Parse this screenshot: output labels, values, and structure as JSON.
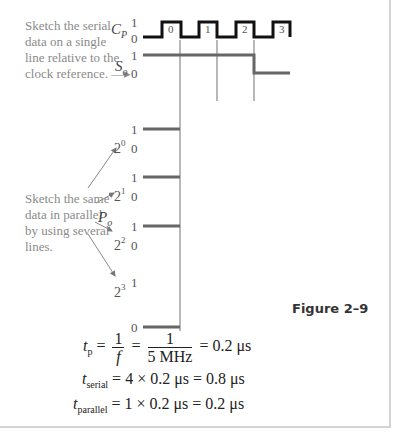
{
  "figure": {
    "label": "Figure 2–9",
    "notes": {
      "serial": [
        "Sketch the serial",
        "data on a single",
        "line relative to the",
        "clock reference. —▸"
      ],
      "parallel": [
        "Sketch the same",
        "data in parallel",
        "by using several",
        "lines."
      ]
    },
    "signals": {
      "clock": {
        "name": "C",
        "sub": "P",
        "high": "1",
        "low": "0",
        "pulse_labels": [
          "0",
          "1",
          "2",
          "3"
        ]
      },
      "serial": {
        "name": "S",
        "sub": "o",
        "high": "1",
        "low": "0"
      },
      "parallel_group": {
        "name": "P",
        "sub": "o"
      },
      "parallel_bits": [
        {
          "base": "2",
          "exp": "0",
          "high": "1",
          "low": "0",
          "value": 1
        },
        {
          "base": "2",
          "exp": "1",
          "high": "1",
          "low": "0",
          "value": 1
        },
        {
          "base": "2",
          "exp": "2",
          "high": "1",
          "low": "0",
          "value": 1
        },
        {
          "base": "2",
          "exp": "3",
          "high": "1",
          "low": "0",
          "value": 0
        }
      ]
    },
    "colors": {
      "clock": "#111111",
      "signal": "#666666",
      "guide": "#888888",
      "note": "#8a8a8a"
    }
  },
  "equations": {
    "eq1": {
      "lhs": "t",
      "lhs_sub": "p",
      "eq": "=",
      "frac1_num": "1",
      "frac1_den": "f",
      "frac2_num": "1",
      "frac2_den": "5 MHz",
      "result": "= 0.2 μs"
    },
    "eq2": {
      "lhs": "t",
      "lhs_sub": "serial",
      "rhs": "= 4 × 0.2 μs = 0.8 μs"
    },
    "eq3": {
      "lhs": "t",
      "lhs_sub": "parallel",
      "rhs": "= 1 × 0.2 μs = 0.2 μs"
    }
  }
}
